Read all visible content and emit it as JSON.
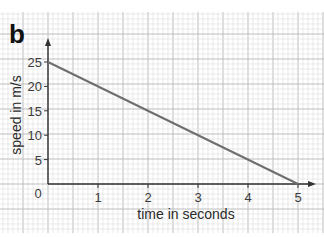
{
  "panel_label": "b",
  "chart_data": {
    "type": "line",
    "title": "",
    "xlabel": "time in seconds",
    "ylabel": "speed in m/s",
    "xlim": [
      0,
      5
    ],
    "ylim": [
      0,
      25
    ],
    "x_ticks": [
      0,
      1,
      2,
      3,
      4,
      5
    ],
    "y_ticks": [
      5,
      10,
      15,
      20,
      25
    ],
    "origin_label": "0",
    "grid": true,
    "series": [
      {
        "name": "speed",
        "x": [
          0,
          5
        ],
        "y": [
          25,
          0
        ],
        "color": "#6e6e6e"
      }
    ]
  },
  "colors": {
    "axis": "#333333",
    "line": "#6e6e6e",
    "grid_minor": "#dcdcdc",
    "grid_major": "#bdbdbd"
  }
}
